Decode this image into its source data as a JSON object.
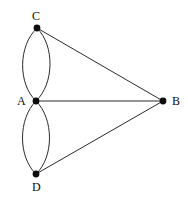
{
  "figure": {
    "kind": "multigraph-diagram",
    "background_color": "#ffffff",
    "stroke_color": "#2b2b2b",
    "vertex_color": "#0d0d0d",
    "label_color": "#0d0d0d"
  },
  "vertices": [
    {
      "id": "C",
      "label": "C",
      "x": 37,
      "y": 28,
      "label_x": 32,
      "label_y": 10
    },
    {
      "id": "A",
      "label": "A",
      "x": 36,
      "y": 101,
      "label_x": 17,
      "label_y": 95
    },
    {
      "id": "B",
      "label": "B",
      "x": 163,
      "y": 101,
      "label_x": 172,
      "label_y": 95
    },
    {
      "id": "D",
      "label": "D",
      "x": 36,
      "y": 174,
      "label_x": 32,
      "label_y": 181
    }
  ],
  "edges": [
    {
      "id": "edge-A-C-left",
      "from": "A",
      "to": "C",
      "style": "curved",
      "bulge": "left"
    },
    {
      "id": "edge-A-C-right",
      "from": "A",
      "to": "C",
      "style": "curved",
      "bulge": "right"
    },
    {
      "id": "edge-A-D-left",
      "from": "A",
      "to": "D",
      "style": "curved",
      "bulge": "left"
    },
    {
      "id": "edge-A-D-right",
      "from": "A",
      "to": "D",
      "style": "curved",
      "bulge": "right"
    },
    {
      "id": "edge-C-B",
      "from": "C",
      "to": "B",
      "style": "straight"
    },
    {
      "id": "edge-A-B",
      "from": "A",
      "to": "B",
      "style": "straight"
    },
    {
      "id": "edge-D-B",
      "from": "D",
      "to": "B",
      "style": "straight"
    }
  ],
  "geometry": {
    "width": 188,
    "height": 201,
    "vertex_radius": 3.2,
    "stroke_width": 1,
    "curve_offset": 19
  }
}
